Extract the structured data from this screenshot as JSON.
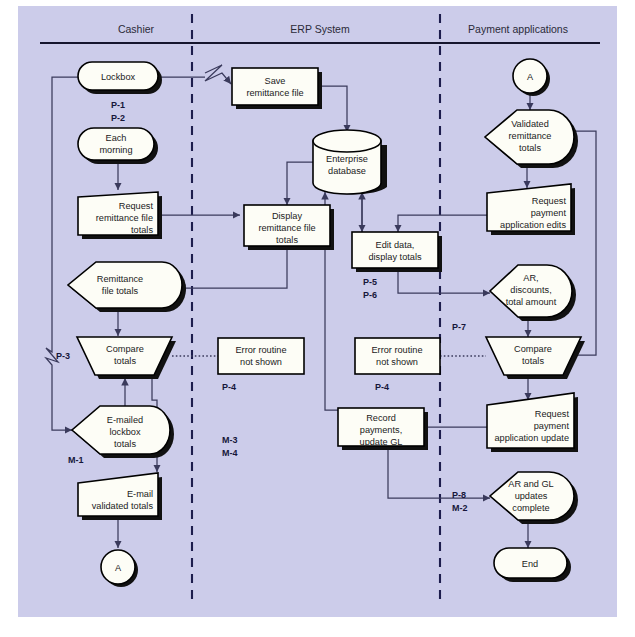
{
  "diagram": {
    "panel_color": "#ccccea",
    "shape_fill": "#fdfdf6",
    "line_color": "#3a3a5c",
    "lanes": [
      {
        "id": "cashier",
        "label": "Cashier"
      },
      {
        "id": "erp",
        "label": "ERP System"
      },
      {
        "id": "payment",
        "label": "Payment applications"
      }
    ],
    "nodes": [
      {
        "id": "lockbox",
        "lane": "cashier",
        "type": "terminator",
        "label": "Lockbox"
      },
      {
        "id": "each-morning",
        "lane": "cashier",
        "type": "terminator",
        "label": "Each\nmorning",
        "line1": "Each",
        "line2": "morning"
      },
      {
        "id": "request-remittance",
        "lane": "cashier",
        "type": "manual-input",
        "line1": "Request",
        "line2": "remittance file",
        "line3": "totals"
      },
      {
        "id": "remittance-totals",
        "lane": "cashier",
        "type": "display",
        "line1": "Remittance",
        "line2": "file totals"
      },
      {
        "id": "compare-totals-left",
        "lane": "cashier",
        "type": "merge",
        "line1": "Compare",
        "line2": "totals"
      },
      {
        "id": "emailed-lockbox",
        "lane": "cashier",
        "type": "display",
        "line1": "E-mailed",
        "line2": "lockbox",
        "line3": "totals"
      },
      {
        "id": "email-validated",
        "lane": "cashier",
        "type": "manual-input",
        "line1": "E-mail",
        "line2": "validated totals"
      },
      {
        "id": "connector-a-bottom",
        "lane": "cashier",
        "type": "connector",
        "label": "A"
      },
      {
        "id": "save-remittance",
        "lane": "erp",
        "type": "process",
        "line1": "Save",
        "line2": "remittance file"
      },
      {
        "id": "display-remittance",
        "lane": "erp",
        "type": "process",
        "line1": "Display",
        "line2": "remittance file",
        "line3": "totals"
      },
      {
        "id": "enterprise-db",
        "lane": "erp",
        "type": "database",
        "line1": "Enterprise",
        "line2": "database"
      },
      {
        "id": "edit-data",
        "lane": "erp",
        "type": "process",
        "line1": "Edit data,",
        "line2": "display totals"
      },
      {
        "id": "error-routine-left",
        "lane": "erp",
        "type": "plain-box",
        "line1": "Error routine",
        "line2": "not shown"
      },
      {
        "id": "error-routine-right",
        "lane": "erp",
        "type": "plain-box",
        "line1": "Error routine",
        "line2": "not shown"
      },
      {
        "id": "record-payments",
        "lane": "erp",
        "type": "process",
        "line1": "Record",
        "line2": "payments,",
        "line3": "update GL"
      },
      {
        "id": "connector-a-top",
        "lane": "payment",
        "type": "connector",
        "label": "A"
      },
      {
        "id": "validated-remittance",
        "lane": "payment",
        "type": "display",
        "line1": "Validated",
        "line2": "remittance",
        "line3": "totals"
      },
      {
        "id": "request-app-edits",
        "lane": "payment",
        "type": "manual-input",
        "line1": "Request",
        "line2": "payment",
        "line3": "application edits"
      },
      {
        "id": "ar-discounts",
        "lane": "payment",
        "type": "display",
        "line1": "AR,",
        "line2": "discounts,",
        "line3": "total amount"
      },
      {
        "id": "compare-totals-right",
        "lane": "payment",
        "type": "merge",
        "line1": "Compare",
        "line2": "totals"
      },
      {
        "id": "request-app-update",
        "lane": "payment",
        "type": "manual-input",
        "line1": "Request",
        "line2": "payment",
        "line3": "application update"
      },
      {
        "id": "ar-gl-updates",
        "lane": "payment",
        "type": "display",
        "line1": "AR and GL",
        "line2": "updates",
        "line3": "complete"
      },
      {
        "id": "end",
        "lane": "payment",
        "type": "terminator",
        "label": "End"
      }
    ],
    "tags": [
      {
        "id": "tag-p1",
        "label": "P-1",
        "near": "lockbox"
      },
      {
        "id": "tag-p2",
        "label": "P-2",
        "near": "lockbox"
      },
      {
        "id": "tag-p3",
        "label": "P-3",
        "near": "compare-totals-left"
      },
      {
        "id": "tag-m1",
        "label": "M-1",
        "near": "emailed-lockbox"
      },
      {
        "id": "tag-p4-left",
        "label": "P-4",
        "near": "error-routine-left"
      },
      {
        "id": "tag-m3",
        "label": "M-3",
        "near": "error-routine-left"
      },
      {
        "id": "tag-m4",
        "label": "M-4",
        "near": "error-routine-left"
      },
      {
        "id": "tag-p5",
        "label": "P-5",
        "near": "edit-data"
      },
      {
        "id": "tag-p6",
        "label": "P-6",
        "near": "edit-data"
      },
      {
        "id": "tag-p4-right",
        "label": "P-4",
        "near": "error-routine-right"
      },
      {
        "id": "tag-p7",
        "label": "P-7",
        "near": "compare-totals-right"
      },
      {
        "id": "tag-p8",
        "label": "P-8",
        "near": "ar-gl-updates"
      },
      {
        "id": "tag-m2",
        "label": "M-2",
        "near": "ar-gl-updates"
      }
    ]
  }
}
